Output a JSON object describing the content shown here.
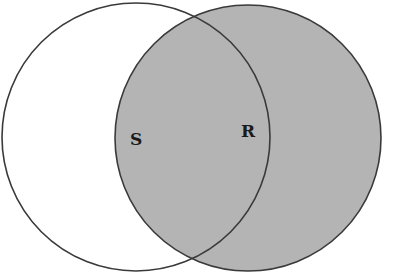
{
  "diagram": {
    "type": "venn",
    "background": "#ffffff",
    "stroke_color": "#3a3a3a",
    "sets": [
      {
        "id": "S",
        "label": "S",
        "cx": 136,
        "cy": 137,
        "r": 134,
        "fill": "none",
        "shaded": false
      },
      {
        "id": "R",
        "label": "R",
        "cx": 248,
        "cy": 138,
        "r": 133,
        "fill": "#b4b4b4",
        "shaded": true
      }
    ],
    "labels": {
      "S": "S",
      "R": "R"
    }
  }
}
